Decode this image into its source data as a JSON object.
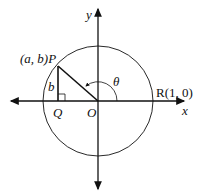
{
  "diagram": {
    "labels": {
      "y_axis": "y",
      "x_axis": "x",
      "point_p": "(a, b)P",
      "point_q": "Q",
      "origin": "O",
      "point_r": "R(1, 0)",
      "side_b": "b",
      "angle": "θ"
    },
    "geometry": {
      "origin": [
        98,
        101
      ],
      "radius": 55,
      "p": [
        58,
        66
      ],
      "q": [
        58,
        101
      ]
    },
    "colors": {
      "stroke": "#111111",
      "background": "#ffffff"
    }
  }
}
